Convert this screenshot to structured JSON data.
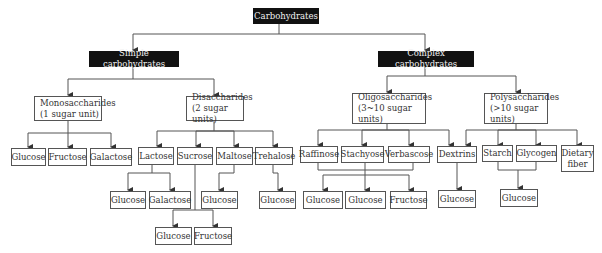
{
  "diagram": {
    "root": {
      "label": "Carbohydrates"
    },
    "simple": {
      "label": "Simple carbohydrates"
    },
    "complex": {
      "label": "Complex carbohydrates"
    },
    "monosaccharides": {
      "label": "Monosaccharides\n(1 sugar unit)",
      "children": [
        "Glucose",
        "Fructose",
        "Galactose"
      ]
    },
    "disaccharides": {
      "label": "Disaccharides\n(2 sugar units)",
      "children": [
        "Lactose",
        "Sucrose",
        "Maltose",
        "Trehalose"
      ]
    },
    "lactose_parts": [
      "Glucose",
      "Galactose"
    ],
    "sucrose_parts": [
      "Glucose",
      "Fructose"
    ],
    "maltose_parts": [
      "Glucose"
    ],
    "trehalose_parts": [
      "Glucose"
    ],
    "oligosaccharides": {
      "label": "Oligosaccharides\n(3~10 sugar units)",
      "children": [
        "Raffinose",
        "Stachyose",
        "Verbascose",
        "Dextrins"
      ]
    },
    "oligo_parts": [
      "Glucose",
      "Glucose",
      "Fructose"
    ],
    "dextrins_parts": [
      "Glucose"
    ],
    "polysaccharides": {
      "label": "Polysaccharides\n(>10 sugar units)",
      "children": [
        "Starch",
        "Glycogen",
        "Dietary\nfiber"
      ]
    },
    "starch_glycogen_parts": [
      "Glucose"
    ]
  },
  "colors": {
    "dark_box": "#111111",
    "line": "#555555",
    "text": "#333333"
  }
}
